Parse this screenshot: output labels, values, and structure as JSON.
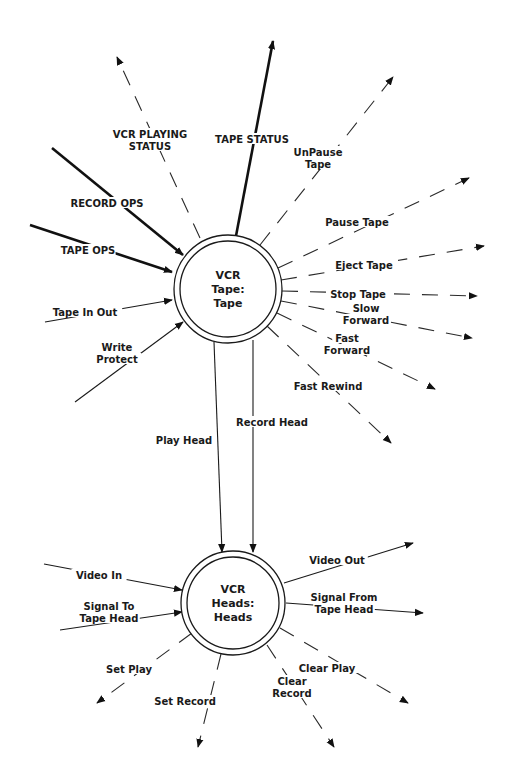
{
  "diagram": {
    "type": "data flow / state transition diagram",
    "nodes": [
      {
        "id": "tape",
        "lines": [
          "VCR",
          "Tape:",
          "Tape"
        ],
        "cx": 228,
        "cy": 289,
        "r_outer": 54,
        "r_inner": 48
      },
      {
        "id": "heads",
        "lines": [
          "VCR",
          "Heads:",
          "Heads"
        ],
        "cx": 233,
        "cy": 603,
        "r_outer": 52,
        "r_inner": 46
      }
    ],
    "flows": [
      {
        "id": "vcr-playing-status",
        "label_lines": [
          "VCR PLAYING",
          "STATUS"
        ],
        "style": "dashed",
        "direction": "out",
        "from": [
          200,
          238
        ],
        "to": [
          117,
          57
        ],
        "label_pos": [
          150,
          142
        ]
      },
      {
        "id": "tape-status",
        "label_lines": [
          "TAPE STATUS"
        ],
        "style": "thick",
        "direction": "out",
        "from": [
          236,
          236
        ],
        "to": [
          273,
          41
        ],
        "label_pos": [
          252,
          141
        ]
      },
      {
        "id": "record-ops",
        "label_lines": [
          "RECORD OPS"
        ],
        "style": "thick",
        "direction": "in",
        "from": [
          52,
          148
        ],
        "to": [
          183,
          255
        ],
        "label_pos": [
          107,
          205
        ]
      },
      {
        "id": "tape-ops",
        "label_lines": [
          "TAPE OPS"
        ],
        "style": "thick",
        "direction": "in",
        "from": [
          30,
          225
        ],
        "to": [
          172,
          272
        ],
        "label_pos": [
          88,
          252
        ]
      },
      {
        "id": "tape-in-out",
        "label_lines": [
          "Tape In Out"
        ],
        "style": "solid",
        "direction": "in",
        "from": [
          45,
          322
        ],
        "to": [
          172,
          300
        ],
        "label_pos": [
          85,
          314
        ]
      },
      {
        "id": "write-protect",
        "label_lines": [
          "Write",
          "Protect"
        ],
        "style": "solid",
        "direction": "in",
        "from": [
          75,
          402
        ],
        "to": [
          183,
          322
        ],
        "label_pos": [
          117,
          355
        ]
      },
      {
        "id": "unpause-tape",
        "label_lines": [
          "UnPause",
          "Tape"
        ],
        "style": "dashed",
        "direction": "out",
        "from": [
          260,
          245
        ],
        "to": [
          393,
          77
        ],
        "label_pos": [
          318,
          160
        ]
      },
      {
        "id": "pause-tape",
        "label_lines": [
          "Pause Tape"
        ],
        "style": "dashed",
        "direction": "out",
        "from": [
          278,
          268
        ],
        "to": [
          469,
          178
        ],
        "label_pos": [
          357,
          224
        ]
      },
      {
        "id": "eject-tape",
        "label_lines": [
          "Eject Tape"
        ],
        "style": "dashed",
        "direction": "out",
        "from": [
          281,
          280
        ],
        "to": [
          484,
          246
        ],
        "label_pos": [
          364,
          267
        ]
      },
      {
        "id": "stop-tape",
        "label_lines": [
          "Stop Tape"
        ],
        "style": "dashed",
        "direction": "out",
        "from": [
          282,
          291
        ],
        "to": [
          477,
          296
        ],
        "label_pos": [
          358,
          296
        ]
      },
      {
        "id": "slow-forward",
        "label_lines": [
          "Slow",
          "Forward"
        ],
        "style": "dashed",
        "direction": "out",
        "from": [
          281,
          301
        ],
        "to": [
          472,
          338
        ],
        "label_pos": [
          366,
          316
        ]
      },
      {
        "id": "fast-forward",
        "label_lines": [
          "Fast",
          "Forward"
        ],
        "style": "dashed",
        "direction": "out",
        "from": [
          277,
          313
        ],
        "to": [
          435,
          389
        ],
        "label_pos": [
          347,
          346
        ]
      },
      {
        "id": "fast-rewind",
        "label_lines": [
          "Fast Rewind"
        ],
        "style": "dashed",
        "direction": "out",
        "from": [
          267,
          326
        ],
        "to": [
          391,
          443
        ],
        "label_pos": [
          328,
          388
        ]
      },
      {
        "id": "play-head",
        "label_lines": [
          "Play Head"
        ],
        "style": "solid",
        "direction": "between",
        "from": [
          214,
          342
        ],
        "to": [
          222,
          552
        ],
        "label_pos": [
          184,
          442
        ]
      },
      {
        "id": "record-head",
        "label_lines": [
          "Record Head"
        ],
        "style": "solid",
        "direction": "between",
        "from": [
          253,
          340
        ],
        "to": [
          253,
          552
        ],
        "label_pos": [
          272,
          424
        ]
      },
      {
        "id": "video-in",
        "label_lines": [
          "Video In"
        ],
        "style": "solid",
        "direction": "in",
        "from": [
          44,
          564
        ],
        "to": [
          182,
          590
        ],
        "label_pos": [
          99,
          577
        ]
      },
      {
        "id": "signal-to-tape-head",
        "label_lines": [
          "Signal To",
          "Tape Head"
        ],
        "style": "solid",
        "direction": "in",
        "from": [
          60,
          630
        ],
        "to": [
          182,
          612
        ],
        "label_pos": [
          109,
          614
        ]
      },
      {
        "id": "set-play",
        "label_lines": [
          "Set Play"
        ],
        "style": "dashed",
        "direction": "out",
        "from": [
          192,
          633
        ],
        "to": [
          97,
          703
        ],
        "label_pos": [
          129,
          671
        ]
      },
      {
        "id": "set-record",
        "label_lines": [
          "Set Record"
        ],
        "style": "dashed",
        "direction": "out",
        "from": [
          221,
          654
        ],
        "to": [
          198,
          747
        ],
        "label_pos": [
          185,
          703
        ]
      },
      {
        "id": "video-out",
        "label_lines": [
          "Video Out"
        ],
        "style": "solid",
        "direction": "out",
        "from": [
          284,
          583
        ],
        "to": [
          413,
          543
        ],
        "label_pos": [
          337,
          562
        ]
      },
      {
        "id": "signal-from-tape-head",
        "label_lines": [
          "Signal From",
          "Tape Head"
        ],
        "style": "solid",
        "direction": "out",
        "from": [
          286,
          603
        ],
        "to": [
          423,
          613
        ],
        "label_pos": [
          344,
          605
        ]
      },
      {
        "id": "clear-play",
        "label_lines": [
          "Clear Play"
        ],
        "style": "dashed",
        "direction": "out",
        "from": [
          280,
          628
        ],
        "to": [
          408,
          703
        ],
        "label_pos": [
          327,
          670
        ]
      },
      {
        "id": "clear-record",
        "label_lines": [
          "Clear",
          "Record"
        ],
        "style": "dashed",
        "direction": "out",
        "from": [
          267,
          645
        ],
        "to": [
          334,
          747
        ],
        "label_pos": [
          292,
          689
        ]
      }
    ]
  }
}
